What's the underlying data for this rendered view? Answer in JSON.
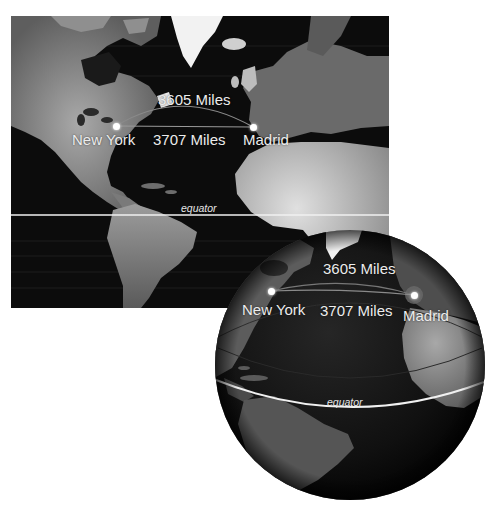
{
  "figure": {
    "flat_map": {
      "cities": [
        {
          "name": "New York"
        },
        {
          "name": "Madrid"
        }
      ],
      "great_circle_label": "3605 Miles",
      "straight_line_label": "3707 Miles",
      "equator_label": "equator"
    },
    "globe": {
      "cities": [
        {
          "name": "New York"
        },
        {
          "name": "Madrid"
        }
      ],
      "great_circle_label": "3605 Miles",
      "straight_line_label": "3707 Miles",
      "equator_label": "equator"
    },
    "colors": {
      "ocean": "#0c0c0c",
      "land": "#6e6e6e",
      "land_bright": "#bdbdbd",
      "ice": "#f2f2f2",
      "route": "#8a8a8a",
      "equator": "#f0f0f0",
      "text": "#ececec"
    }
  }
}
